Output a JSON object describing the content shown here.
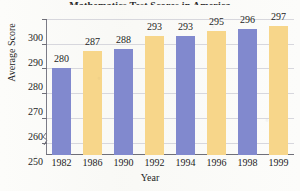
{
  "chart_data": {
    "type": "bar",
    "title": "Mathematics Test Scores in America",
    "title_visible": false,
    "xlabel": "Year",
    "ylabel": "Average Score",
    "categories": [
      "1982",
      "1986",
      "1990",
      "1992",
      "1994",
      "1996",
      "1998",
      "1999"
    ],
    "values": [
      280,
      287,
      288,
      293,
      293,
      295,
      296,
      297
    ],
    "value_labels": [
      "280",
      "287",
      "288",
      "293",
      "293",
      "295",
      "296",
      "297"
    ],
    "ylim": [
      245,
      300
    ],
    "yticks": [
      300,
      290,
      280,
      270,
      260,
      250
    ],
    "ytick_labels": [
      "300",
      "290",
      "280",
      "270",
      "260",
      "250"
    ],
    "grid": true,
    "legend": false,
    "axis_break": true,
    "bar_colors": [
      "#8189ce",
      "#f7d68a"
    ],
    "grid_color": "#d7d7dd",
    "axis_color": "#6f6f78",
    "text_color": "#1d1d1d",
    "background": "#fcfcfa"
  }
}
